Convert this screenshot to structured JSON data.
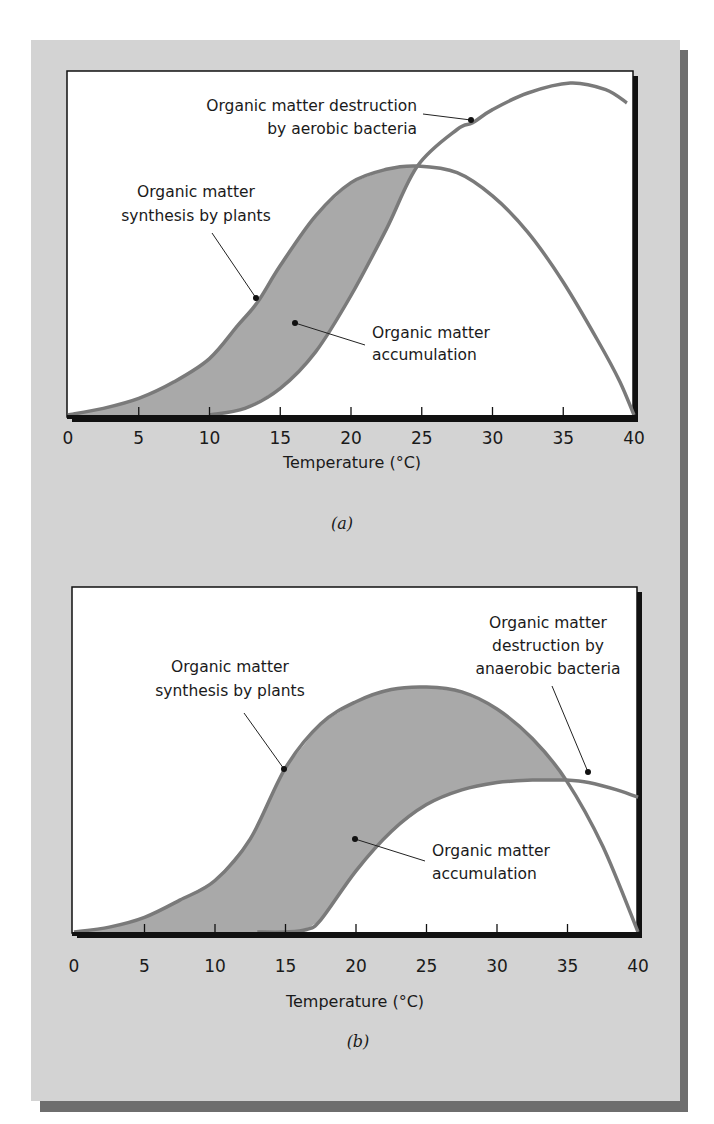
{
  "colors": {
    "page_bg": "#ffffff",
    "panel_bg": "#d3d3d3",
    "panel_shadow": "#6e6e6e",
    "plot_bg": "#ffffff",
    "plot_border": "#111111",
    "curve": "#7a7a7a",
    "fill": "#a9a9a9",
    "text": "#1a1a1a"
  },
  "chart_data": [
    {
      "id": "a",
      "type": "area",
      "panel_label": "(a)",
      "title": "",
      "xlabel": "Temperature (°C)",
      "ylabel": "",
      "xlim": [
        0,
        40
      ],
      "ylim": [
        0,
        100
      ],
      "xticks": [
        "0",
        "5",
        "10",
        "15",
        "20",
        "25",
        "30",
        "35",
        "40"
      ],
      "grid": false,
      "series": [
        {
          "name": "Organic matter synthesis by plants",
          "x": [
            0,
            2.5,
            5,
            7.5,
            10,
            12,
            13.4,
            15,
            17.5,
            20,
            22.5,
            24.7,
            27.5,
            30,
            32.5,
            35,
            37.5,
            39,
            40
          ],
          "y": [
            0,
            2,
            5,
            10,
            17,
            27,
            34,
            45,
            60,
            70,
            74,
            75,
            73,
            66,
            55,
            40,
            22,
            10,
            0
          ]
        },
        {
          "name": "Organic matter destruction by aerobic bacteria",
          "x": [
            10,
            12.5,
            15,
            17.5,
            20,
            22.5,
            24.7,
            27.5,
            28.6,
            30,
            32.5,
            35.5,
            38,
            39.5
          ],
          "y": [
            0,
            2,
            8,
            19,
            36,
            56,
            75,
            86,
            88,
            92,
            97,
            100,
            98,
            94
          ]
        }
      ],
      "shaded_region": "Organic matter accumulation (between synthesis and destruction curves, 0–24.7 °C)",
      "annotations": [
        {
          "text": "Organic matter destruction by aerobic bacteria",
          "x": 28.6,
          "target": "destruction curve"
        },
        {
          "text": "Organic matter synthesis by plants",
          "x": 13.4,
          "target": "synthesis curve"
        },
        {
          "text": "Organic matter accumulation",
          "x": 16,
          "target": "shaded region"
        }
      ]
    },
    {
      "id": "b",
      "type": "area",
      "panel_label": "(b)",
      "title": "",
      "xlabel": "Temperature (°C)",
      "ylabel": "",
      "xlim": [
        0,
        40
      ],
      "ylim": [
        0,
        100
      ],
      "xticks": [
        "0",
        "5",
        "10",
        "15",
        "20",
        "25",
        "30",
        "35",
        "40"
      ],
      "grid": false,
      "series": [
        {
          "name": "Organic matter synthesis by plants",
          "x": [
            0,
            2.5,
            5,
            7.5,
            10,
            12.5,
            15,
            17.5,
            20,
            22.5,
            25,
            27.5,
            30,
            32.5,
            34.9,
            37.5,
            40
          ],
          "y": [
            0,
            2,
            6,
            13,
            21,
            38,
            67,
            85,
            94,
            99,
            100,
            98,
            91,
            79,
            62,
            35,
            0
          ]
        },
        {
          "name": "Organic matter destruction by anaerobic bacteria",
          "x": [
            13,
            15,
            16.5,
            17.5,
            20,
            22.5,
            25,
            27.5,
            30,
            32.5,
            33.5,
            34.9,
            36.5,
            38.5,
            40
          ],
          "y": [
            0,
            0,
            1,
            5,
            25,
            41,
            52,
            58,
            61,
            62,
            62,
            62,
            61,
            58,
            55
          ]
        }
      ],
      "shaded_region": "Organic matter accumulation (between synthesis and destruction curves, 0–34.9 °C)",
      "annotations": [
        {
          "text": "Organic matter destruction by anaerobic bacteria",
          "x": 36.5,
          "target": "destruction curve"
        },
        {
          "text": "Organic matter synthesis by plants",
          "x": 15,
          "target": "synthesis curve"
        },
        {
          "text": "Organic matter accumulation",
          "x": 20,
          "target": "shaded region"
        }
      ]
    }
  ],
  "labels": {
    "a": {
      "destruction_line1": "Organic matter destruction",
      "destruction_line2": "by aerobic bacteria",
      "synthesis_line1": "Organic matter",
      "synthesis_line2": "synthesis by plants",
      "accumulation_line1": "Organic matter",
      "accumulation_line2": "accumulation",
      "xlabel": "Temperature (°C)",
      "panel": "(a)",
      "ticks": [
        "0",
        "5",
        "10",
        "15",
        "20",
        "25",
        "30",
        "35",
        "40"
      ]
    },
    "b": {
      "destruction_line1": "Organic matter",
      "destruction_line2": "destruction by",
      "destruction_line3": "anaerobic bacteria",
      "synthesis_line1": "Organic matter",
      "synthesis_line2": "synthesis by plants",
      "accumulation_line1": "Organic matter",
      "accumulation_line2": "accumulation",
      "xlabel": "Temperature (°C)",
      "panel": "(b)",
      "ticks": [
        "0",
        "5",
        "10",
        "15",
        "20",
        "25",
        "30",
        "35",
        "40"
      ]
    }
  }
}
